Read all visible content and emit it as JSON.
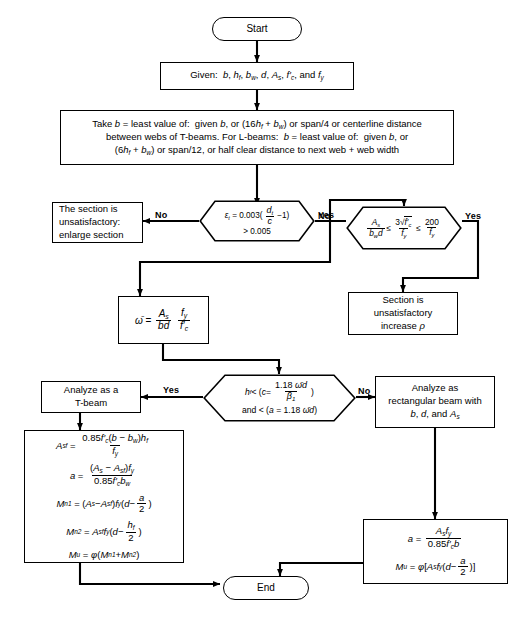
{
  "diagram": {
    "type": "flowchart",
    "nodes": [
      {
        "id": "start",
        "shape": "terminator",
        "text": "Start"
      },
      {
        "id": "given",
        "shape": "process",
        "text": "Given:  b, h_f, b_w, d, A_s, f'_c, and f_y"
      },
      {
        "id": "take_b",
        "shape": "process",
        "line1": "Take b = least value of:  given b, or (16h_f + b_w) or span/4 or centerline distance",
        "line2": "between webs of T-beams. For L-beams:  b = least value of:  given b, or",
        "line3": "(6h_f + b_w) or span/12, or half clear distance to next web + web width"
      },
      {
        "id": "d1",
        "shape": "decision",
        "line1": "ε_t = 0.003(d_t/c − 1)",
        "line2": "> 0.005",
        "yes": "Yes",
        "no": "No"
      },
      {
        "id": "unsat_enlarge",
        "shape": "process",
        "line1": "The section is",
        "line2": "unsatisfactory:",
        "line3": "enlarge section"
      },
      {
        "id": "d2",
        "shape": "decision",
        "expr": "A_s/(b_w d) ≤ 3√f'_c/f_y ≤ 200/f_y",
        "yes": "Yes",
        "no": "No"
      },
      {
        "id": "unsat_rho",
        "shape": "process",
        "line1": "Section is",
        "line2": "unsatisfactory",
        "line3": "increase ρ"
      },
      {
        "id": "omega",
        "shape": "process",
        "expr": "ω̄ = A_s/(bd) · f_y/f'_c"
      },
      {
        "id": "d3",
        "shape": "decision",
        "line1": "h_f < (c = 1.18 ω̄d / β₁)",
        "line2": "and < (a = 1.18 ω̄d)",
        "yes": "Yes",
        "no": "No"
      },
      {
        "id": "tbeam",
        "shape": "process",
        "line1": "Analyze as a",
        "line2": "T-beam"
      },
      {
        "id": "rect",
        "shape": "process",
        "line1": "Analyze as",
        "line2": "rectangular beam with",
        "line3": "b, d, and A_s"
      },
      {
        "id": "tform",
        "shape": "process",
        "eq1": "A_sf = 0.85f'_c(b − b_w)h_f / f_y",
        "eq2": "a = (A_s − A_sf)f_y / 0.85f'_c b_w",
        "eq3": "M_n1 = (A_s − A_sf)f_y(d − a/2)",
        "eq4": "M_n2 = A_sf f_y(d − h_f/2)",
        "eq5": "M_u = φ(M_n1 + M_n2)"
      },
      {
        "id": "rform",
        "shape": "process",
        "eq1": "a = A_s f_y / 0.85f'_c b",
        "eq2": "M_u = φ[A_s f_y(d − a/2)]"
      },
      {
        "id": "end",
        "shape": "terminator",
        "text": "End"
      }
    ],
    "symbols": {
      "start": "Start",
      "end": "End",
      "given_label": "Given:",
      "take_prefix": "Take",
      "yes": "Yes",
      "no": "No",
      "omega_bar": "ω̄",
      "epsilon_t": "ε",
      "phi": "φ",
      "rho": "ρ",
      "beta1": "β",
      "le": "≤",
      "lt": "<",
      "gt": ">",
      "minus": "−",
      "plus": "+"
    },
    "colors": {
      "stroke": "#000000",
      "background": "#ffffff",
      "text": "#000000"
    }
  }
}
